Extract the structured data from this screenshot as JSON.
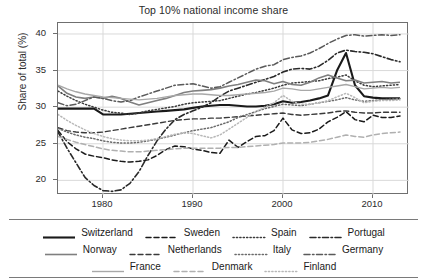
{
  "chart_data": {
    "type": "line",
    "title": "Top 10% national income share",
    "xlabel": "",
    "ylabel": "Share of total (%)",
    "xlim": [
      1975,
      2014
    ],
    "ylim": [
      18,
      41.5
    ],
    "yticks": [
      20,
      25,
      30,
      35,
      40
    ],
    "xticks": [
      1980,
      1990,
      2000,
      2010
    ],
    "grid": true,
    "legend_position": "bottom",
    "x": [
      1975,
      1976,
      1977,
      1978,
      1979,
      1980,
      1981,
      1982,
      1983,
      1984,
      1985,
      1986,
      1987,
      1988,
      1989,
      1990,
      1991,
      1992,
      1993,
      1994,
      1995,
      1996,
      1997,
      1998,
      1999,
      2000,
      2001,
      2002,
      2003,
      2004,
      2005,
      2006,
      2007,
      2008,
      2009,
      2010,
      2011,
      2012,
      2013
    ],
    "series": [
      {
        "name": "Switzerland",
        "style": "solid",
        "color": "#1a1a1a",
        "width": 2.1,
        "values": [
          29.8,
          29.8,
          29.8,
          29.8,
          29.8,
          29.0,
          29.0,
          29.0,
          29.1,
          29.2,
          29.3,
          29.4,
          29.5,
          29.6,
          29.7,
          29.9,
          30.1,
          30.2,
          30.3,
          30.3,
          30.2,
          30.1,
          30.1,
          30.2,
          30.4,
          30.8,
          30.6,
          30.7,
          30.9,
          31.2,
          31.6,
          35.0,
          37.4,
          33.0,
          31.5,
          31.3,
          31.2,
          31.2,
          31.2
        ]
      },
      {
        "name": "Sweden",
        "style": "dashed",
        "color": "#1a1a1a",
        "width": 1.5,
        "values": [
          26.8,
          25.3,
          24.3,
          23.6,
          23.3,
          23.1,
          22.8,
          22.6,
          22.5,
          22.6,
          22.8,
          23.4,
          24.2,
          24.7,
          24.6,
          24.3,
          24.1,
          23.8,
          23.7,
          25.5,
          24.5,
          25.3,
          26.0,
          26.1,
          26.8,
          28.5,
          26.9,
          26.4,
          26.5,
          27.0,
          28.0,
          28.6,
          29.4,
          28.3,
          28.0,
          28.9,
          28.6,
          28.6,
          28.8
        ]
      },
      {
        "name": "Spain",
        "style": "dotted",
        "color": "#3a3a3a",
        "width": 1.5,
        "values": [
          32.2,
          31.5,
          30.9,
          30.4,
          30.0,
          29.6,
          29.3,
          29.2,
          29.0,
          29.2,
          29.5,
          29.7,
          29.9,
          30.1,
          30.4,
          30.6,
          30.7,
          30.8,
          30.9,
          31.2,
          31.5,
          31.8,
          32.0,
          32.3,
          32.6,
          33.0,
          33.3,
          33.4,
          33.5,
          33.6,
          33.9,
          34.1,
          34.4,
          33.6,
          33.0,
          32.8,
          32.9,
          33.0,
          33.1
        ]
      },
      {
        "name": "Portugal",
        "style": "dashdot",
        "color": "#2a2a2a",
        "width": 1.6,
        "values": [
          26.6,
          24.4,
          22.4,
          20.4,
          19.3,
          18.6,
          18.5,
          18.7,
          19.6,
          21.2,
          23.4,
          25.4,
          27.0,
          28.3,
          29.0,
          29.5,
          30.0,
          30.6,
          31.5,
          32.2,
          32.6,
          33.0,
          33.4,
          33.8,
          34.2,
          34.8,
          35.2,
          35.3,
          35.2,
          35.6,
          36.4,
          37.4,
          37.8,
          37.6,
          37.5,
          37.3,
          36.9,
          36.5,
          36.2
        ]
      },
      {
        "name": "Norway",
        "style": "solid",
        "color": "#7f7f7f",
        "width": 1.6,
        "values": [
          32.9,
          31.9,
          31.4,
          31.2,
          31.4,
          31.2,
          31.5,
          31.2,
          30.7,
          30.3,
          30.6,
          30.9,
          31.2,
          31.6,
          32.0,
          32.2,
          32.3,
          32.4,
          32.6,
          32.9,
          33.1,
          33.4,
          33.7,
          33.6,
          33.2,
          33.5,
          33.1,
          33.0,
          33.4,
          34.0,
          34.4,
          34.0,
          33.6,
          33.7,
          33.3,
          33.4,
          33.5,
          33.3,
          33.4
        ]
      },
      {
        "name": "Netherlands",
        "style": "dashed",
        "color": "#3a3a3a",
        "width": 1.4,
        "values": [
          27.2,
          26.8,
          26.6,
          26.5,
          26.5,
          26.6,
          26.8,
          27.0,
          27.2,
          27.4,
          27.6,
          27.8,
          28.0,
          28.2,
          28.3,
          28.4,
          28.4,
          28.5,
          28.5,
          28.6,
          28.7,
          28.8,
          28.9,
          29.0,
          29.1,
          29.2,
          29.0,
          28.9,
          29.0,
          29.1,
          29.2,
          29.4,
          29.5,
          29.3,
          29.2,
          29.2,
          29.3,
          29.3,
          29.3
        ]
      },
      {
        "name": "Italy",
        "style": "dotted",
        "color": "#6b6b6b",
        "width": 1.5,
        "values": [
          27.1,
          26.6,
          26.2,
          25.9,
          25.7,
          25.4,
          25.2,
          25.1,
          25.1,
          25.2,
          25.4,
          25.6,
          25.9,
          26.2,
          26.5,
          26.8,
          27.0,
          27.2,
          27.6,
          28.0,
          28.6,
          29.0,
          29.4,
          29.8,
          30.1,
          30.4,
          30.3,
          30.2,
          30.4,
          30.6,
          30.8,
          31.0,
          31.3,
          31.0,
          30.8,
          30.9,
          31.0,
          31.1,
          31.2
        ]
      },
      {
        "name": "Germany",
        "style": "dashdot",
        "color": "#5a5a5a",
        "width": 1.5,
        "values": [
          30.6,
          30.2,
          30.4,
          30.9,
          31.4,
          31.2,
          30.9,
          30.7,
          30.9,
          31.4,
          31.8,
          32.2,
          32.6,
          33.0,
          33.1,
          33.2,
          32.9,
          32.6,
          32.8,
          33.4,
          34.0,
          34.6,
          35.2,
          35.6,
          35.8,
          36.5,
          36.8,
          37.0,
          37.4,
          38.0,
          38.7,
          39.3,
          39.8,
          39.9,
          39.7,
          39.8,
          39.9,
          39.8,
          39.9
        ]
      },
      {
        "name": "France",
        "style": "solid",
        "color": "#a8a8a8",
        "width": 1.4,
        "values": [
          33.0,
          32.5,
          32.1,
          31.8,
          31.6,
          31.4,
          31.3,
          31.2,
          31.1,
          31.0,
          31.1,
          31.2,
          31.4,
          31.6,
          31.7,
          31.8,
          31.8,
          31.7,
          31.6,
          31.6,
          31.7,
          31.8,
          31.9,
          32.0,
          32.2,
          32.6,
          32.5,
          32.3,
          32.3,
          32.5,
          32.7,
          32.9,
          33.1,
          32.8,
          32.5,
          32.6,
          32.7,
          32.6,
          32.7
        ]
      },
      {
        "name": "Denmark",
        "style": "dashed",
        "color": "#b0b0b0",
        "width": 1.5,
        "values": [
          26.0,
          25.6,
          25.2,
          24.9,
          24.6,
          24.3,
          24.1,
          24.0,
          23.9,
          23.9,
          24.0,
          24.1,
          24.2,
          24.3,
          24.4,
          24.4,
          24.4,
          24.4,
          24.4,
          24.5,
          24.5,
          24.6,
          24.7,
          24.8,
          24.9,
          25.1,
          25.1,
          25.1,
          25.2,
          25.4,
          25.6,
          25.9,
          26.2,
          26.0,
          25.9,
          26.2,
          26.4,
          26.5,
          26.6
        ]
      },
      {
        "name": "Finland",
        "style": "dotted",
        "color": "#b8b8b8",
        "width": 1.5,
        "values": [
          29.0,
          28.2,
          27.5,
          26.9,
          26.4,
          26.0,
          25.7,
          25.5,
          25.4,
          25.4,
          25.5,
          25.7,
          26.0,
          26.3,
          26.5,
          26.4,
          26.1,
          25.8,
          26.2,
          27.0,
          27.8,
          28.6,
          29.4,
          30.0,
          30.6,
          31.6,
          30.8,
          30.4,
          30.4,
          30.6,
          30.9,
          31.4,
          31.9,
          31.3,
          30.6,
          30.8,
          30.9,
          30.9,
          31.0
        ]
      }
    ]
  },
  "legend": {
    "rows": [
      [
        {
          "label": "Switzerland",
          "key": 0
        },
        {
          "label": "Sweden",
          "key": 1
        },
        {
          "label": "Spain",
          "key": 2
        },
        {
          "label": "Portugal",
          "key": 3
        }
      ],
      [
        {
          "label": "Norway",
          "key": 4
        },
        {
          "label": "Netherlands",
          "key": 5
        },
        {
          "label": "Italy",
          "key": 6
        },
        {
          "label": "Germany",
          "key": 7
        }
      ],
      [
        {
          "label": "France",
          "key": 8
        },
        {
          "label": "Denmark",
          "key": 9
        },
        {
          "label": "Finland",
          "key": 10
        }
      ]
    ]
  }
}
